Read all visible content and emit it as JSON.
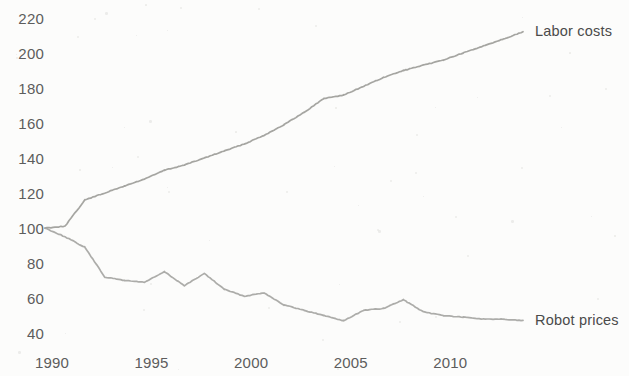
{
  "chart_data": {
    "type": "line",
    "title": "",
    "subtitle": "",
    "xlabel": "",
    "ylabel": "",
    "xlim": [
      1990,
      2014
    ],
    "ylim": [
      40,
      220
    ],
    "grid": false,
    "legend_position": "right-inline-labels",
    "x_ticks": [
      "1990",
      "1995",
      "2000",
      "2005",
      "2010"
    ],
    "x_tick_values": [
      1990,
      1995,
      2000,
      2005,
      2010
    ],
    "y_ticks": [
      "220",
      "200",
      "180",
      "160",
      "140",
      "120",
      "100",
      "80",
      "60",
      "40"
    ],
    "y_tick_values": [
      220,
      200,
      180,
      160,
      140,
      120,
      100,
      80,
      60,
      40
    ],
    "x": [
      1990,
      1991,
      1992,
      1993,
      1994,
      1995,
      1996,
      1997,
      1998,
      1999,
      2000,
      2001,
      2002,
      2003,
      2004,
      2005,
      2006,
      2007,
      2008,
      2009,
      2010,
      2011,
      2012,
      2013,
      2014
    ],
    "series": [
      {
        "name": "Labor costs",
        "color": "#a0a09c",
        "values": [
          100,
          101,
          116,
          120,
          124,
          128,
          133,
          136,
          140,
          144,
          148,
          153,
          159,
          166,
          174,
          176,
          181,
          186,
          190,
          193,
          196,
          200,
          204,
          208,
          212
        ]
      },
      {
        "name": "Robot prices",
        "color": "#a8a8a4",
        "values": [
          100,
          95,
          89,
          72,
          70,
          69,
          75,
          67,
          74,
          65,
          61,
          63,
          56,
          53,
          50,
          47,
          53,
          54,
          59,
          52,
          50,
          49,
          48,
          48,
          47
        ]
      }
    ],
    "annotations": [
      {
        "text": "Labor costs",
        "series": "Labor costs",
        "x": 2014,
        "y": 212
      },
      {
        "text": "Robot prices",
        "series": "Robot prices",
        "x": 2014,
        "y": 47
      }
    ]
  },
  "axis": {
    "y_labels": [
      "220",
      "200",
      "180",
      "160",
      "140",
      "120",
      "100",
      "80",
      "60",
      "40"
    ],
    "x_labels": [
      "1990",
      "1995",
      "2000",
      "2005",
      "2010"
    ]
  },
  "labels": {
    "labor_costs": "Labor costs",
    "robot_prices": "Robot prices"
  },
  "colors": {
    "background": "#fcfcfb",
    "line": "#a0a09c",
    "text": "#5d5d5d"
  }
}
